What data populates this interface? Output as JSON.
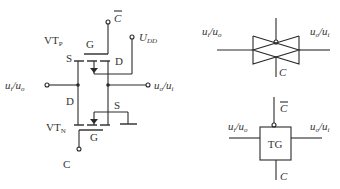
{
  "circuit": {
    "labels": {
      "c_bar": "C",
      "udd": "U",
      "udd_sub": "DD",
      "vtp": "VT",
      "vtp_sub": "P",
      "vtn": "VT",
      "vtn_sub": "N",
      "gate_p": "G",
      "gate_n": "G",
      "source_p": "S",
      "drain_p": "D",
      "drain_n": "D",
      "source_n": "S",
      "c": "C",
      "in_left": "u",
      "in_left_sub1": "i",
      "in_left_mid": "/u",
      "in_left_sub2": "o",
      "out_right": "u",
      "out_right_sub1": "o",
      "out_right_mid": "/u",
      "out_right_sub2": "i"
    }
  },
  "symbol_bowtie": {
    "left_label": "u",
    "left_sub1": "i",
    "left_mid": "/u",
    "left_sub2": "o",
    "right_label": "u",
    "right_sub1": "o",
    "right_mid": "/u",
    "right_sub2": "i",
    "bottom_label": "C"
  },
  "symbol_tg": {
    "top_label": "C",
    "box_label": "TG",
    "left_label": "u",
    "left_sub1": "i",
    "left_mid": "/u",
    "left_sub2": "o",
    "right_label": "u",
    "right_sub1": "o",
    "right_mid": "/u",
    "right_sub2": "i",
    "bottom_label": "C"
  }
}
